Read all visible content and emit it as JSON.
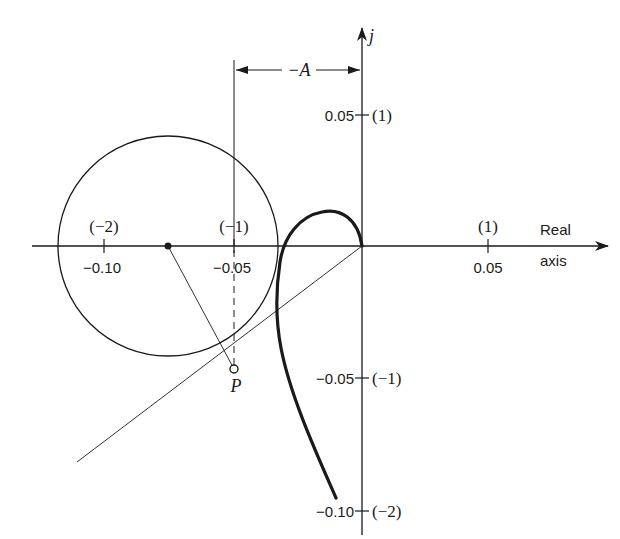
{
  "figure": {
    "axes": {
      "real_axis_label_line1": "Real",
      "real_axis_label_line2": "axis",
      "imag_axis_label": "j",
      "real_ticks": [
        {
          "value": "-0.10",
          "scaled": "(-2)"
        },
        {
          "value": "-0.05",
          "scaled": "(-1)"
        },
        {
          "value": "0.05",
          "scaled": "(1)"
        }
      ],
      "imag_ticks": [
        {
          "value": "0.05",
          "scaled": "(1)"
        },
        {
          "value": "-0.05",
          "scaled": "(-1)"
        },
        {
          "value": "-0.10",
          "scaled": "(-2)"
        }
      ]
    },
    "annotations": {
      "dimension_label": "-A",
      "tangent_point_label": "P"
    },
    "colors": {
      "ink": "#1a1a1a",
      "background": "#ffffff"
    }
  },
  "labels": {
    "real_tick_neg010": "−0.10",
    "real_tick_neg010_scaled": "(−2)",
    "real_tick_neg005": "−0.05",
    "real_tick_neg005_scaled": "(−1)",
    "real_tick_pos005": "0.05",
    "real_tick_pos005_scaled": "(1)",
    "imag_tick_pos005": "0.05",
    "imag_tick_pos005_scaled": "(1)",
    "imag_tick_neg005": "−0.05",
    "imag_tick_neg005_scaled": "(−1)",
    "imag_tick_neg010": "−0.10",
    "imag_tick_neg010_scaled": "(−2)",
    "real_axis_1": "Real",
    "real_axis_2": "axis",
    "imag_axis": "j",
    "dimension": "−A",
    "point_p": "P"
  }
}
